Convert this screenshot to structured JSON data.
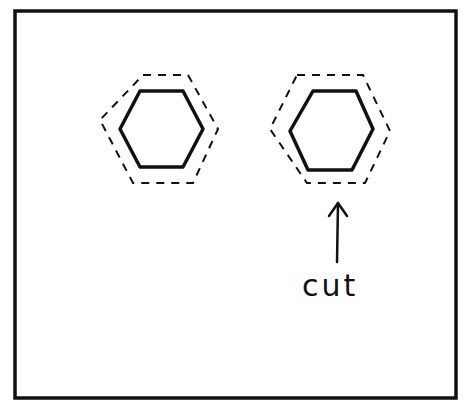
{
  "diagram": {
    "colors": {
      "stroke": "#111111",
      "background": "#ffffff"
    },
    "frame": {
      "x": 15,
      "y": 11,
      "w": 441,
      "h": 387
    },
    "shapes": [
      {
        "name": "left-hexagon",
        "solid": "140,91 183,91 203,129 183,167 140,167 120,129",
        "dashed": "143,75 188,75 218,129 193,183 133,183 100,120"
      },
      {
        "name": "right-hexagon",
        "solid": "313,91 356,91 373,129 352,170 308,170 290,131",
        "dashed": "297,75 363,75 390,131 365,183 307,183 270,129"
      }
    ],
    "arrow": {
      "x": 338,
      "y_top": 203,
      "y_bottom": 262
    },
    "annotation": {
      "text": "cut",
      "x": 302,
      "y": 268
    }
  }
}
